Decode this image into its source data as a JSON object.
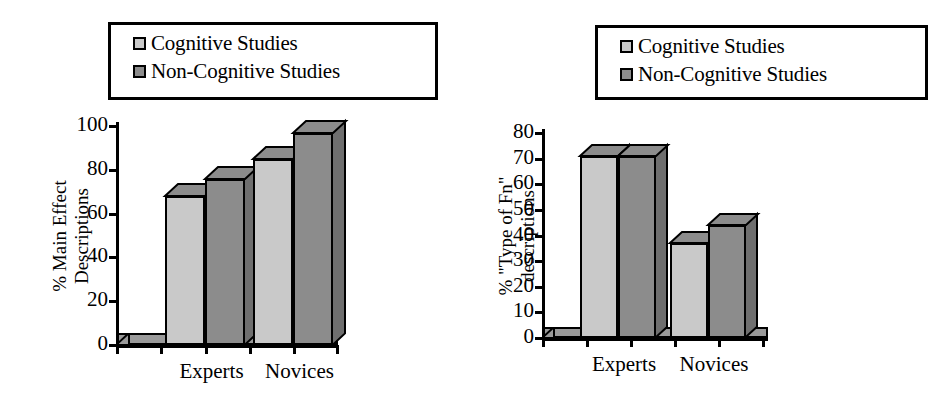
{
  "figure": {
    "background": "#ffffff",
    "colors": {
      "cognitive": "#c9c9c9",
      "non_cognitive": "#8c8c8c",
      "top_face": "#8c8c8c",
      "side_face": "#6f6f6f",
      "outline": "#000000",
      "floor": "#9a9a9a"
    }
  },
  "legend": {
    "items": [
      {
        "label": "Cognitive Studies",
        "color": "#c9c9c9"
      },
      {
        "label": "Non-Cognitive Studies",
        "color": "#8c8c8c"
      }
    ]
  },
  "chart_data": [
    {
      "type": "bar",
      "id": "main-effect-descriptions",
      "title": "",
      "xlabel": "",
      "ylabel": "% Main Effect Descriptions",
      "ylabel_lines": [
        "% Main Effect",
        "Descriptions"
      ],
      "categories": [
        "Experts",
        "Novices"
      ],
      "yticks": [
        0,
        20,
        40,
        60,
        80,
        100
      ],
      "ylim": [
        0,
        100
      ],
      "grid": false,
      "legend_position": "top-left",
      "series": [
        {
          "name": "Cognitive Studies",
          "color": "#c9c9c9",
          "values": [
            68,
            85
          ]
        },
        {
          "name": "Non-Cognitive Studies",
          "color": "#8c8c8c",
          "values": [
            76,
            97
          ]
        }
      ]
    },
    {
      "type": "bar",
      "id": "type-of-fn-descriptions",
      "title": "",
      "xlabel": "",
      "ylabel": "% \"Type of Fn\" descriptions",
      "ylabel_lines": [
        "% \"Type of Fn\"",
        "descriptions"
      ],
      "categories": [
        "Experts",
        "Novices"
      ],
      "yticks": [
        0,
        10,
        20,
        30,
        40,
        50,
        60,
        70,
        80
      ],
      "ylim": [
        0,
        80
      ],
      "grid": false,
      "legend_position": "top-right",
      "series": [
        {
          "name": "Cognitive Studies",
          "color": "#c9c9c9",
          "values": [
            71,
            37
          ]
        },
        {
          "name": "Non-Cognitive Studies",
          "color": "#8c8c8c",
          "values": [
            71,
            44
          ]
        }
      ]
    }
  ]
}
